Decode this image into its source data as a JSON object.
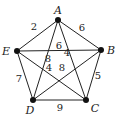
{
  "graph": {
    "nodes": [
      {
        "id": "A",
        "label": "A"
      },
      {
        "id": "B",
        "label": "B"
      },
      {
        "id": "C",
        "label": "C"
      },
      {
        "id": "D",
        "label": "D"
      },
      {
        "id": "E",
        "label": "E"
      }
    ],
    "edges": [
      {
        "from": "A",
        "to": "B",
        "weight": "6"
      },
      {
        "from": "A",
        "to": "E",
        "weight": "2"
      },
      {
        "from": "B",
        "to": "C",
        "weight": "5"
      },
      {
        "from": "D",
        "to": "E",
        "weight": "7"
      },
      {
        "from": "C",
        "to": "D",
        "weight": "9"
      },
      {
        "from": "E",
        "to": "B",
        "weight": "6"
      },
      {
        "from": "A",
        "to": "D",
        "weight": "8"
      },
      {
        "from": "A",
        "to": "C",
        "weight": "4"
      },
      {
        "from": "E",
        "to": "C",
        "weight": "4"
      },
      {
        "from": "B",
        "to": "D",
        "weight": "8"
      }
    ]
  }
}
